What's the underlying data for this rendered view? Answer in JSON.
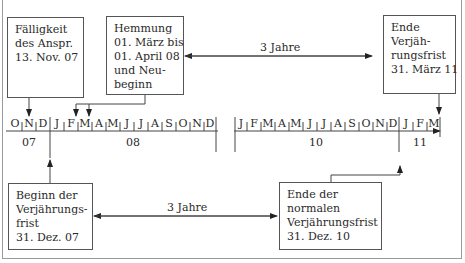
{
  "diagram": {
    "type": "timeline",
    "boxes": {
      "faelligkeit": [
        "Fälligkeit",
        "des Anspr.",
        "13. Nov. 07"
      ],
      "hemmung": [
        "Hemmung",
        "01. März bis",
        "01. April 08",
        "und Neu-",
        "beginn"
      ],
      "ende_verjaehrung": [
        "Ende",
        "Verjäh-",
        "rungsfrist",
        "31. März 11"
      ],
      "beginn": [
        "Beginn der",
        "Verjährungs-",
        "frist",
        "31. Dez. 07"
      ],
      "ende_normal": [
        "Ende der",
        "normalen",
        "Verjährungsfrist",
        "31. Dez. 10"
      ]
    },
    "spans": {
      "top": "3 Jahre",
      "bottom": "3 Jahre"
    },
    "timeline": {
      "segment1_months": [
        "O",
        "N",
        "D",
        "J",
        "F",
        "M",
        "A",
        "M",
        "J",
        "J",
        "A",
        "S",
        "O",
        "N",
        "D"
      ],
      "segment2_months": [
        "J",
        "F",
        "M",
        "A",
        "M",
        "J",
        "J",
        "A",
        "S",
        "O",
        "N",
        "D",
        "J",
        "F",
        "M"
      ],
      "years": [
        "07",
        "08",
        "10",
        "11"
      ]
    }
  }
}
